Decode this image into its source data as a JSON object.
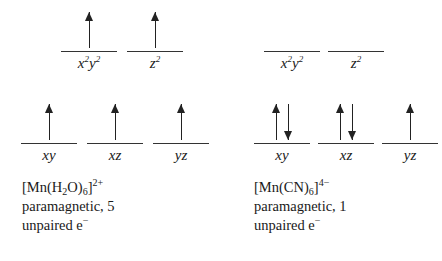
{
  "diagram": {
    "line_color": "#333333",
    "arrow_color": "#222222",
    "background": "#ffffff"
  },
  "complexes": [
    {
      "id": "mn-h2o-6",
      "formula_parts": {
        "open_bracket": "[",
        "metal": "Mn",
        "ligand_open": "(",
        "ligand_main": "H",
        "ligand_sub": "2",
        "ligand_rest": "O",
        "ligand_close": ")",
        "ligand_count": "6",
        "close_bracket": "]",
        "charge": "2+"
      },
      "magnetism": "paramagnetic, 5",
      "unpaired_text": "unpaired e",
      "unpaired_charge": "−",
      "eg_orbitals": [
        {
          "label_main": "x",
          "label_sup1": "2",
          "label_mid": "y",
          "label_sup2": "2",
          "electrons": [
            "up"
          ]
        },
        {
          "label_main": "z",
          "label_sup1": "2",
          "label_mid": "",
          "label_sup2": "",
          "electrons": [
            "up"
          ]
        }
      ],
      "t2g_orbitals": [
        {
          "label": "xy",
          "electrons": [
            "up"
          ]
        },
        {
          "label": "xz",
          "electrons": [
            "up"
          ]
        },
        {
          "label": "yz",
          "electrons": [
            "up"
          ]
        }
      ]
    },
    {
      "id": "mn-cn-6",
      "formula_parts": {
        "open_bracket": "[",
        "metal": "Mn",
        "ligand_open": "(",
        "ligand_main": "CN",
        "ligand_sub": "",
        "ligand_rest": "",
        "ligand_close": ")",
        "ligand_count": "6",
        "close_bracket": "]",
        "charge": "4−"
      },
      "magnetism": "paramagnetic, 1",
      "unpaired_text": "unpaired e",
      "unpaired_charge": "−",
      "eg_orbitals": [
        {
          "label_main": "x",
          "label_sup1": "2",
          "label_mid": "y",
          "label_sup2": "2",
          "electrons": []
        },
        {
          "label_main": "z",
          "label_sup1": "2",
          "label_mid": "",
          "label_sup2": "",
          "electrons": []
        }
      ],
      "t2g_orbitals": [
        {
          "label": "xy",
          "electrons": [
            "up",
            "down"
          ]
        },
        {
          "label": "xz",
          "electrons": [
            "up",
            "down"
          ]
        },
        {
          "label": "yz",
          "electrons": [
            "up"
          ]
        }
      ]
    }
  ]
}
